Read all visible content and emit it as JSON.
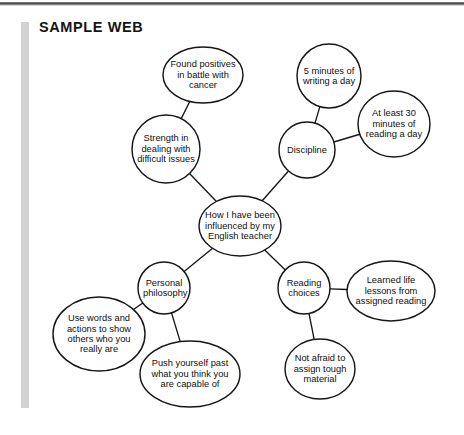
{
  "document": {
    "title": "SAMPLE WEB",
    "type": "idea-web-diagram"
  },
  "colors": {
    "page_background": "#ffffff",
    "ink": "#0f0f0f",
    "node_stroke": "#161616",
    "link_stroke": "#161616",
    "node_fill": "#ffffff",
    "margin_bar": "#d2d2d2",
    "scan_edge": "#3c3c3c"
  },
  "web": {
    "center": {
      "id": "center",
      "label": "How I have been influenced by my English teacher",
      "shape": "ellipse",
      "cx": 240,
      "cy": 226,
      "rx": 41,
      "ry": 30
    },
    "branches": [
      {
        "id": "strength",
        "label": "Strength in dealing with difficult issues",
        "shape": "circle",
        "cx": 166,
        "cy": 149,
        "rx": 34,
        "ry": 34,
        "children": [
          {
            "id": "found-positives",
            "label": "Found positives in battle with cancer",
            "shape": "ellipse",
            "cx": 203,
            "cy": 75,
            "rx": 40,
            "ry": 28
          }
        ]
      },
      {
        "id": "discipline",
        "label": "Discipline",
        "shape": "circle",
        "cx": 307,
        "cy": 150,
        "rx": 28,
        "ry": 28,
        "children": [
          {
            "id": "five-minutes-writing",
            "label": "5 minutes of writing a day",
            "shape": "circle",
            "cx": 329,
            "cy": 76,
            "rx": 32,
            "ry": 32
          },
          {
            "id": "thirty-minutes-reading",
            "label": "At least 30 minutes of reading a day",
            "shape": "circle",
            "cx": 394,
            "cy": 124,
            "rx": 36,
            "ry": 33
          }
        ]
      },
      {
        "id": "personal-philosophy",
        "label": "Personal philosophy",
        "shape": "circle",
        "cx": 164,
        "cy": 288,
        "rx": 26,
        "ry": 26,
        "children": [
          {
            "id": "use-words-actions",
            "label": "Use words and actions to show others who you really are",
            "shape": "ellipse",
            "cx": 99,
            "cy": 334,
            "rx": 46,
            "ry": 37
          },
          {
            "id": "push-yourself",
            "label": "Push yourself past what you think you are capable of",
            "shape": "ellipse",
            "cx": 190,
            "cy": 374,
            "rx": 50,
            "ry": 33
          }
        ]
      },
      {
        "id": "reading-choices",
        "label": "Reading choices",
        "shape": "circle",
        "cx": 304,
        "cy": 288,
        "rx": 26,
        "ry": 26,
        "children": [
          {
            "id": "learned-life-lessons",
            "label": "Learned life lessons from assigned reading",
            "shape": "ellipse",
            "cx": 391,
            "cy": 291,
            "rx": 44,
            "ry": 30
          },
          {
            "id": "not-afraid-tough",
            "label": "Not afraid to assign tough material",
            "shape": "ellipse",
            "cx": 320,
            "cy": 369,
            "rx": 35,
            "ry": 30
          }
        ]
      }
    ],
    "links": [
      {
        "from": "center",
        "to": "strength"
      },
      {
        "from": "center",
        "to": "discipline"
      },
      {
        "from": "center",
        "to": "personal-philosophy"
      },
      {
        "from": "center",
        "to": "reading-choices"
      },
      {
        "from": "strength",
        "to": "found-positives"
      },
      {
        "from": "discipline",
        "to": "five-minutes-writing"
      },
      {
        "from": "discipline",
        "to": "thirty-minutes-reading"
      },
      {
        "from": "personal-philosophy",
        "to": "use-words-actions"
      },
      {
        "from": "personal-philosophy",
        "to": "push-yourself"
      },
      {
        "from": "reading-choices",
        "to": "learned-life-lessons"
      },
      {
        "from": "reading-choices",
        "to": "not-afraid-tough"
      }
    ]
  }
}
